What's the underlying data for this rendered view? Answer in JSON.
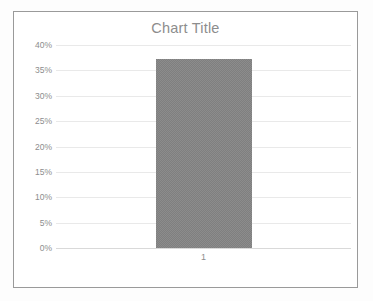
{
  "chart_data": {
    "type": "bar",
    "title": "Chart Title",
    "xlabel": "",
    "ylabel": "",
    "categories": [
      "1"
    ],
    "values": [
      37.3
    ],
    "series": [
      {
        "name": "Series 1",
        "values": [
          37.3
        ]
      }
    ],
    "ylim": [
      0,
      40
    ],
    "ytick_labels": [
      "40%",
      "35%",
      "30%",
      "25%",
      "20%",
      "15%",
      "10%",
      "5%",
      "0%"
    ],
    "ytick_values": [
      40,
      35,
      30,
      25,
      20,
      15,
      10,
      5,
      0
    ],
    "grid": true,
    "legend": false,
    "colors": {
      "bar": "#7f7f7f",
      "gridline": "#e9e9e9",
      "axis_text": "#8d8d8d",
      "title_text": "#8d8d8d",
      "border": "#9a9a9a",
      "plot_background": "#ffffff",
      "page_background": "#fdfdfd"
    }
  }
}
